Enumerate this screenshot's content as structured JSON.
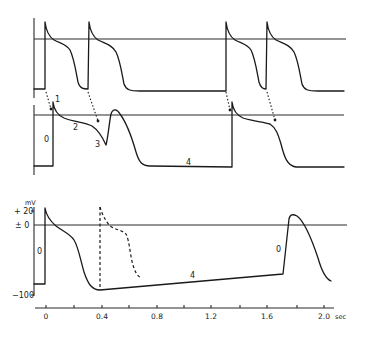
{
  "diagram": {
    "top_panel": {
      "description": "Atrial/ventricular action potentials (reference trace)"
    },
    "middle_panel": {
      "phase_labels": {
        "p0": "0",
        "p1": "1",
        "p2": "2",
        "p3": "3",
        "p4": "4"
      }
    },
    "bottom_panel": {
      "y_unit": "mV",
      "y_ticks": [
        "+ 20",
        "± 0",
        "−100"
      ],
      "phase_labels": {
        "p0_left": "0",
        "p4": "4",
        "p0_right": "0"
      }
    },
    "x_axis": {
      "tick_labels": [
        "0",
        "0.4",
        "0.8",
        "1.2",
        "1.6",
        "2.0"
      ],
      "unit": "sec"
    }
  }
}
